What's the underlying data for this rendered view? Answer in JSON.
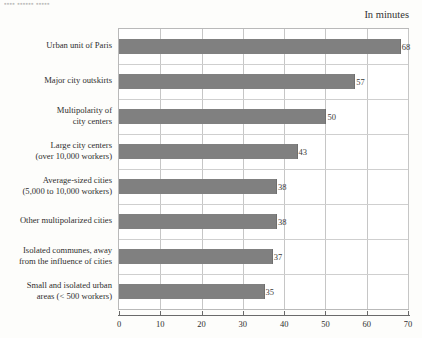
{
  "title_fragment": "▪▪▪▪ ▪▪▪▪▪▪ ▪▪▪▪▪",
  "unit_note": "In minutes",
  "chart_data": {
    "type": "bar",
    "orientation": "horizontal",
    "title": "",
    "subtitle": "In minutes",
    "xlabel": "",
    "ylabel": "",
    "xlim": [
      0,
      70
    ],
    "xticks": [
      0,
      10,
      20,
      30,
      40,
      50,
      60,
      70
    ],
    "grid": true,
    "legend": false,
    "bar_color": "#808080",
    "categories": [
      "Urban unit of Paris",
      "Major city outskirts",
      "Multipolarity of city centers",
      "Large city centers (over 10,000 workers)",
      "Average-sized cities (5,000 to 10,000 workers)",
      "Other multipolarized cities",
      "Isolated communes, away from the influence of cities",
      "Small and isolated urban areas (< 500 workers)"
    ],
    "category_lines": [
      [
        "Urban unit of Paris"
      ],
      [
        "Major city outskirts"
      ],
      [
        "Multipolarity of",
        "city centers"
      ],
      [
        "Large city centers",
        "(over 10,000 workers)"
      ],
      [
        "Average-sized cities",
        "(5,000 to 10,000 workers)"
      ],
      [
        "Other multipolarized cities"
      ],
      [
        "Isolated communes, away",
        "from the influence of cities"
      ],
      [
        "Small and isolated urban",
        "areas (< 500 workers)"
      ]
    ],
    "values": [
      68,
      57,
      50,
      43,
      38,
      38,
      37,
      35
    ],
    "value_labels": [
      "68",
      "57",
      "50",
      "43",
      "38",
      "38",
      "37",
      "35"
    ]
  }
}
